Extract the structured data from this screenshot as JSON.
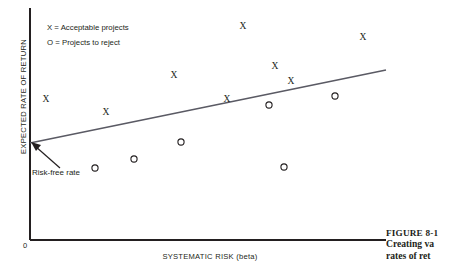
{
  "figure": {
    "axes": {
      "ylabel": "EXPECTED RATE OF RETURN",
      "xlabel": "SYSTEMATIC RISK (beta)",
      "origin_label": "0"
    },
    "legend": {
      "acceptable": "X = Acceptable projects",
      "reject": "O = Projects to reject"
    },
    "annotation": {
      "risk_free_rate": "Risk-free rate"
    },
    "caption": {
      "figure_number": "FIGURE 8-1",
      "line1": "Creating va",
      "line2": "rates of ret"
    },
    "colors": {
      "axis": "#231f20",
      "line": "#5a5a64",
      "marker": "#231f20",
      "background": "#ffffff"
    }
  },
  "chart_data": {
    "type": "scatter",
    "title": "",
    "xlabel": "SYSTEMATIC RISK (beta)",
    "ylabel": "EXPECTED RATE OF RETURN",
    "xlim": [
      0,
      1
    ],
    "ylim": [
      0,
      1
    ],
    "grid": false,
    "legend_position": "top-left",
    "note": "Security market line with project points above (accept) and below (reject) the line.",
    "series": [
      {
        "name": "X = Acceptable projects",
        "marker": "X",
        "points": [
          {
            "px": 46,
            "py": 100
          },
          {
            "px": 106,
            "py": 113
          },
          {
            "px": 174,
            "py": 76
          },
          {
            "px": 227,
            "py": 100
          },
          {
            "px": 243,
            "py": 27
          },
          {
            "px": 275,
            "py": 67
          },
          {
            "px": 291,
            "py": 82
          },
          {
            "px": 363,
            "py": 38
          }
        ]
      },
      {
        "name": "O = Projects to reject",
        "marker": "O",
        "points": [
          {
            "px": 95,
            "py": 168
          },
          {
            "px": 134,
            "py": 159
          },
          {
            "px": 181,
            "py": 142
          },
          {
            "px": 269,
            "py": 105
          },
          {
            "px": 284,
            "py": 167
          },
          {
            "px": 335,
            "py": 96
          }
        ]
      }
    ],
    "security_market_line": {
      "name": "Security market line",
      "start": {
        "px": 30,
        "py": 143
      },
      "end": {
        "px": 386,
        "py": 70
      },
      "intercept_label": "Risk-free rate"
    },
    "axis_geometry": {
      "y_axis": {
        "x": 30,
        "y_top": 8,
        "y_bottom": 240
      },
      "x_axis": {
        "y": 240,
        "x_left": 30,
        "x_right": 386
      }
    }
  }
}
